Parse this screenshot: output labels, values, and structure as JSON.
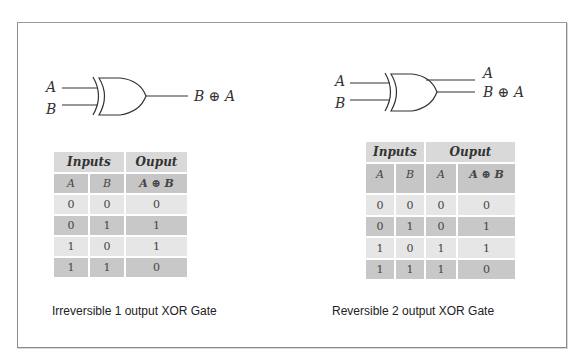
{
  "left": {
    "gate": {
      "input_a_label": "A",
      "input_b_label": "B",
      "output_label": "B ⊕ A"
    },
    "table": {
      "group_headers": [
        "Inputs",
        "Ouput"
      ],
      "column_headers": [
        "A",
        "B",
        "A ⊕ B"
      ],
      "rows": [
        [
          "0",
          "0",
          "0"
        ],
        [
          "0",
          "1",
          "1"
        ],
        [
          "1",
          "0",
          "1"
        ],
        [
          "1",
          "1",
          "0"
        ]
      ]
    },
    "caption": "Irreversible 1 output XOR Gate"
  },
  "right": {
    "gate": {
      "input_a_label": "A",
      "input_b_label": "B",
      "output_a_label": "A",
      "output_label": "B ⊕ A"
    },
    "table": {
      "group_headers": [
        "Inputs",
        "Ouput"
      ],
      "column_headers": [
        "A",
        "B",
        "A",
        "A ⊕ B"
      ],
      "rows": [
        [
          "0",
          "0",
          "0",
          "0"
        ],
        [
          "0",
          "1",
          "0",
          "1"
        ],
        [
          "1",
          "0",
          "1",
          "1"
        ],
        [
          "1",
          "1",
          "1",
          "0"
        ]
      ]
    },
    "caption": "Reversible 2 output XOR Gate"
  },
  "colors": {
    "frame_border": "#8a8a8a",
    "header_bg": "#d9d9d9",
    "subheader_bg": "#c6c6c6",
    "row_light": "#e6e6e6",
    "row_dark": "#c8c8c8"
  }
}
